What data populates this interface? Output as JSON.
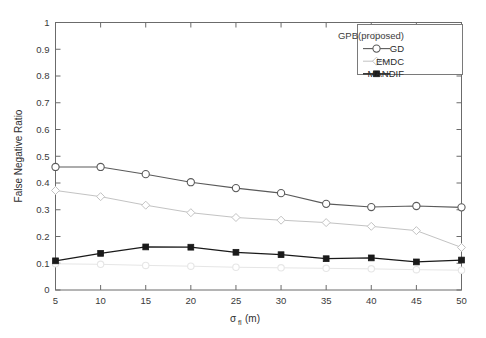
{
  "chart_data": {
    "type": "line",
    "title": "",
    "subtitle": "",
    "xlabel": "σ_fl(m)",
    "xlabel_base": "σ",
    "xlabel_sub": "fl",
    "xlabel_unit": "(m)",
    "ylabel": "False Negative Ratio",
    "x": [
      5,
      10,
      15,
      20,
      25,
      30,
      35,
      40,
      45,
      50
    ],
    "xlim": [
      5,
      50
    ],
    "ylim": [
      0,
      1
    ],
    "xticks": [
      "5",
      "10",
      "15",
      "20",
      "25",
      "30",
      "35",
      "40",
      "45",
      "50"
    ],
    "yticks": [
      "0",
      "0.1",
      "0.2",
      "0.3",
      "0.4",
      "0.5",
      "0.6",
      "0.7",
      "0.8",
      "0.9",
      "1"
    ],
    "grid": false,
    "legend_position": "top-right",
    "series": [
      {
        "name": "GPB(proposed)",
        "values": [
          0.098,
          0.096,
          0.092,
          0.089,
          0.085,
          0.083,
          0.081,
          0.079,
          0.076,
          0.074
        ],
        "color": "#e6e6e6",
        "marker": "circle-open",
        "marker_size": 3.2,
        "line_width": 1.0
      },
      {
        "name": "GD",
        "values": [
          0.46,
          0.46,
          0.433,
          0.403,
          0.381,
          0.362,
          0.322,
          0.31,
          0.314,
          0.309
        ],
        "color": "#5a5a5a",
        "marker": "circle-open",
        "marker_size": 3.6,
        "line_width": 1.1
      },
      {
        "name": "EMDC",
        "values": [
          0.372,
          0.349,
          0.317,
          0.289,
          0.271,
          0.261,
          0.252,
          0.238,
          0.222,
          0.159
        ],
        "color": "#c3c3c3",
        "marker": "diamond-open",
        "marker_size": 3.4,
        "line_width": 1.0
      },
      {
        "name": "MANDIF",
        "values": [
          0.109,
          0.137,
          0.161,
          0.16,
          0.141,
          0.132,
          0.117,
          0.12,
          0.105,
          0.112
        ],
        "color": "#1a1a1a",
        "marker": "square-filled",
        "marker_size": 2.9,
        "line_width": 1.3
      }
    ]
  },
  "legend": {
    "entries": [
      {
        "label": "GPB(proposed)"
      },
      {
        "label": "GD"
      },
      {
        "label": "EMDC"
      },
      {
        "label": "MANDIF"
      }
    ]
  },
  "axes": {
    "y_title": "False Negative Ratio",
    "x_sigma": "σ",
    "x_sub": "fl",
    "x_unit": "(m)"
  },
  "colors": {
    "axis": "#6b6b6b",
    "background": "#ffffff",
    "gd": "#5a5a5a",
    "emdc": "#c3c3c3",
    "mandif": "#1a1a1a",
    "gpb": "#e6e6e6"
  }
}
